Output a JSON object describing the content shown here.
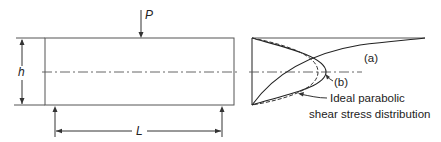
{
  "diagram": {
    "type": "beam shear stress distribution",
    "beam": {
      "load_label": "P",
      "height_label": "h",
      "span_label": "L"
    },
    "stress_profile": {
      "curve_a_label": "(a)",
      "curve_b_label": "(b)",
      "ideal_label_line1": "Ideal parabolic",
      "ideal_label_line2": "shear stress distribution"
    },
    "colors": {
      "line": "#333333",
      "background": "#ffffff"
    }
  }
}
